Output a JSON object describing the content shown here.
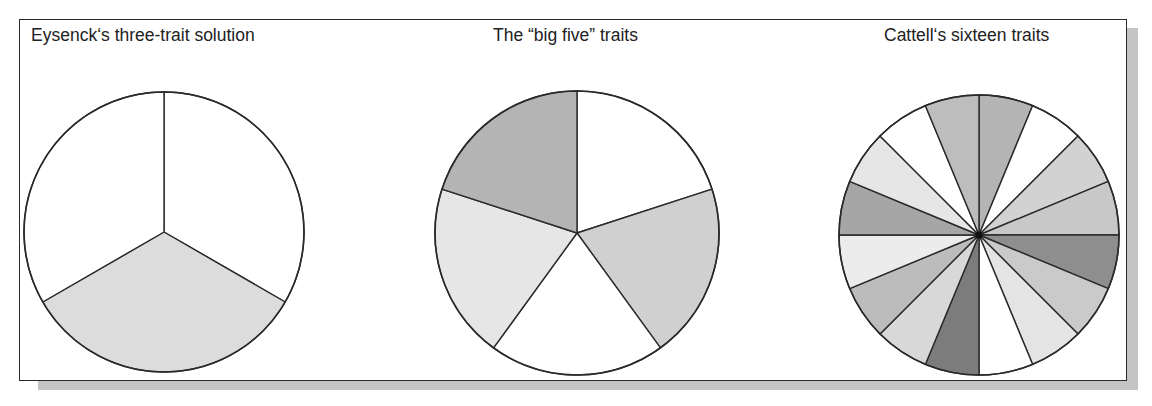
{
  "figure": {
    "panels": [
      {
        "title": "Eysenck‘s three-trait solution",
        "slice_count": 3,
        "center": [
          164,
          232
        ],
        "radius": 140,
        "start_angle_deg": 0,
        "fills": [
          "#ffffff",
          "#dcdcdc",
          "#ffffff"
        ]
      },
      {
        "title": "The “big five” traits",
        "slice_count": 5,
        "center": [
          577,
          233
        ],
        "radius": 142,
        "start_angle_deg": 0,
        "fills": [
          "#ffffff",
          "#d0d0d0",
          "#ffffff",
          "#e6e6e6",
          "#b4b4b4"
        ]
      },
      {
        "title": "Cattell‘s sixteen traits",
        "slice_count": 16,
        "center": [
          979,
          235
        ],
        "radius": 140,
        "start_angle_deg": 0,
        "fills": [
          "#b4b4b4",
          "#ffffff",
          "#d2d2d2",
          "#c8c8c8",
          "#8e8e8e",
          "#cacaca",
          "#e4e4e4",
          "#ffffff",
          "#7c7c7c",
          "#d8d8d8",
          "#bcbcbc",
          "#ececec",
          "#a6a6a6",
          "#e6e6e6",
          "#ffffff",
          "#bdbdbd"
        ]
      }
    ],
    "stroke_color": "#2a2a2a",
    "frame_color": "#2a2a2a",
    "shadow_color": "#c4c4c4"
  },
  "chart_data": [
    {
      "type": "pie",
      "title": "Eysenck‘s three-trait solution",
      "categories": [
        "Trait 1",
        "Trait 2",
        "Trait 3"
      ],
      "values": [
        1,
        1,
        1
      ]
    },
    {
      "type": "pie",
      "title": "The “big five” traits",
      "categories": [
        "Trait 1",
        "Trait 2",
        "Trait 3",
        "Trait 4",
        "Trait 5"
      ],
      "values": [
        1,
        1,
        1,
        1,
        1
      ]
    },
    {
      "type": "pie",
      "title": "Cattell‘s sixteen traits",
      "categories": [
        "Trait 1",
        "Trait 2",
        "Trait 3",
        "Trait 4",
        "Trait 5",
        "Trait 6",
        "Trait 7",
        "Trait 8",
        "Trait 9",
        "Trait 10",
        "Trait 11",
        "Trait 12",
        "Trait 13",
        "Trait 14",
        "Trait 15",
        "Trait 16"
      ],
      "values": [
        1,
        1,
        1,
        1,
        1,
        1,
        1,
        1,
        1,
        1,
        1,
        1,
        1,
        1,
        1,
        1
      ]
    }
  ]
}
